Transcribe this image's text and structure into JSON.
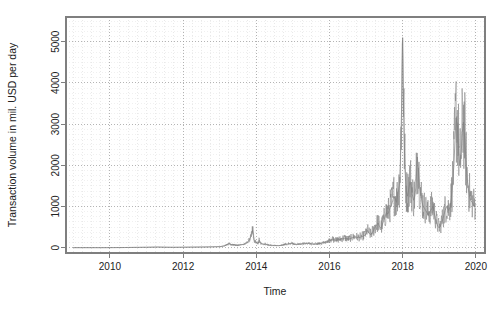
{
  "figure": {
    "background_color": "#ffffff",
    "width": 504,
    "height": 315
  },
  "chart_data": {
    "type": "line",
    "title": "",
    "subtitle": "",
    "xlabel": "Time",
    "ylabel": "Transaction volume in mil. USD per day",
    "xlim": [
      2008.8,
      2020.25
    ],
    "ylim": [
      -130,
      5600
    ],
    "grid": true,
    "grid_style": "dotted",
    "grid_color": "#c8c8c8",
    "legend": null,
    "legend_position": "none",
    "line_color": "#808080",
    "line_width": 0.7,
    "box_color": "#7f7f7f",
    "xticks": [
      2010,
      2012,
      2014,
      2016,
      2018,
      2020
    ],
    "xtick_labels": [
      "2010",
      "2012",
      "2014",
      "2016",
      "2018",
      "2020"
    ],
    "yticks": [
      0,
      1000,
      2000,
      3000,
      4000,
      5000
    ],
    "ytick_labels": [
      "0",
      "1000",
      "2000",
      "3000",
      "4000",
      "5000"
    ],
    "minor_xgrid_spacing": 0.25,
    "minor_ygrid_spacing": 125,
    "annotations": [],
    "series": [
      {
        "name": "Transaction volume",
        "x": [
          2009.0,
          2009.1,
          2009.2,
          2009.3,
          2009.4,
          2009.5,
          2009.6,
          2009.7,
          2009.8,
          2009.9,
          2010.0,
          2010.1,
          2010.2,
          2010.3,
          2010.4,
          2010.5,
          2010.6,
          2010.7,
          2010.8,
          2010.9,
          2011.0,
          2011.1,
          2011.2,
          2011.3,
          2011.4,
          2011.5,
          2011.6,
          2011.7,
          2011.8,
          2011.9,
          2012.0,
          2012.1,
          2012.2,
          2012.3,
          2012.4,
          2012.5,
          2012.6,
          2012.7,
          2012.8,
          2012.9,
          2013.0,
          2013.05,
          2013.1,
          2013.15,
          2013.2,
          2013.25,
          2013.3,
          2013.35,
          2013.4,
          2013.45,
          2013.5,
          2013.55,
          2013.6,
          2013.65,
          2013.7,
          2013.75,
          2013.8,
          2013.85,
          2013.88,
          2013.9,
          2013.92,
          2013.94,
          2013.96,
          2013.98,
          2014.0,
          2014.02,
          2014.05,
          2014.08,
          2014.1,
          2014.12,
          2014.15,
          2014.18,
          2014.2,
          2014.25,
          2014.3,
          2014.35,
          2014.4,
          2014.45,
          2014.5,
          2014.55,
          2014.6,
          2014.65,
          2014.7,
          2014.75,
          2014.8,
          2014.85,
          2014.9,
          2014.95,
          2015.0,
          2015.05,
          2015.1,
          2015.15,
          2015.2,
          2015.25,
          2015.3,
          2015.35,
          2015.4,
          2015.45,
          2015.5,
          2015.55,
          2015.6,
          2015.65,
          2015.7,
          2015.75,
          2015.8,
          2015.85,
          2015.9,
          2015.95,
          2016.0,
          2016.05,
          2016.1,
          2016.15,
          2016.2,
          2016.25,
          2016.3,
          2016.35,
          2016.4,
          2016.45,
          2016.5,
          2016.55,
          2016.6,
          2016.65,
          2016.7,
          2016.75,
          2016.8,
          2016.85,
          2016.9,
          2016.95,
          2017.0,
          2017.03,
          2017.06,
          2017.1,
          2017.13,
          2017.16,
          2017.2,
          2017.23,
          2017.26,
          2017.3,
          2017.33,
          2017.36,
          2017.4,
          2017.43,
          2017.46,
          2017.5,
          2017.53,
          2017.56,
          2017.6,
          2017.63,
          2017.66,
          2017.7,
          2017.73,
          2017.76,
          2017.8,
          2017.83,
          2017.86,
          2017.89,
          2017.92,
          2017.94,
          2017.96,
          2017.98,
          2018.0,
          2018.01,
          2018.02,
          2018.04,
          2018.06,
          2018.08,
          2018.1,
          2018.13,
          2018.16,
          2018.2,
          2018.23,
          2018.26,
          2018.3,
          2018.33,
          2018.36,
          2018.4,
          2018.43,
          2018.46,
          2018.5,
          2018.53,
          2018.56,
          2018.6,
          2018.63,
          2018.66,
          2018.7,
          2018.73,
          2018.76,
          2018.8,
          2018.83,
          2018.86,
          2018.9,
          2018.93,
          2018.96,
          2019.0,
          2019.03,
          2019.06,
          2019.1,
          2019.13,
          2019.16,
          2019.2,
          2019.23,
          2019.26,
          2019.3,
          2019.33,
          2019.36,
          2019.4,
          2019.43,
          2019.46,
          2019.5,
          2019.53,
          2019.56,
          2019.6,
          2019.63,
          2019.66,
          2019.7,
          2019.73,
          2019.76,
          2019.8,
          2019.83,
          2019.86,
          2019.9,
          2019.93,
          2019.96,
          2020.0
        ],
        "values": [
          0,
          0,
          0,
          0,
          0,
          0,
          0,
          0,
          0,
          0,
          1,
          1,
          2,
          2,
          3,
          4,
          5,
          6,
          7,
          8,
          9,
          10,
          12,
          14,
          12,
          10,
          9,
          8,
          8,
          9,
          10,
          11,
          12,
          13,
          14,
          15,
          16,
          18,
          20,
          22,
          25,
          30,
          38,
          50,
          70,
          95,
          80,
          70,
          65,
          60,
          58,
          62,
          70,
          80,
          95,
          120,
          180,
          260,
          340,
          420,
          300,
          200,
          160,
          140,
          120,
          110,
          100,
          180,
          130,
          105,
          95,
          90,
          85,
          80,
          70,
          62,
          58,
          55,
          52,
          50,
          48,
          52,
          60,
          72,
          80,
          88,
          95,
          100,
          92,
          85,
          80,
          78,
          82,
          88,
          95,
          100,
          105,
          98,
          92,
          88,
          86,
          90,
          95,
          100,
          110,
          125,
          140,
          155,
          170,
          180,
          195,
          185,
          175,
          190,
          200,
          215,
          230,
          220,
          205,
          215,
          230,
          245,
          260,
          250,
          240,
          255,
          270,
          290,
          330,
          420,
          380,
          330,
          310,
          360,
          400,
          480,
          520,
          560,
          600,
          520,
          470,
          520,
          600,
          700,
          780,
          850,
          820,
          900,
          980,
          1050,
          1150,
          1250,
          1180,
          1100,
          1250,
          1400,
          1600,
          2100,
          2900,
          3900,
          5100,
          4600,
          3700,
          2700,
          2000,
          1600,
          1350,
          1250,
          1400,
          1600,
          1500,
          1300,
          1150,
          1250,
          1450,
          2200,
          1900,
          1500,
          1250,
          1100,
          1000,
          950,
          900,
          850,
          800,
          850,
          900,
          950,
          1000,
          850,
          700,
          600,
          520,
          480,
          520,
          600,
          700,
          800,
          900,
          1000,
          950,
          900,
          1000,
          1200,
          1500,
          2000,
          2600,
          3150,
          2900,
          2400,
          2000,
          2300,
          2800,
          3050,
          2600,
          2100,
          1700,
          1400,
          1250,
          1150,
          1100,
          1050,
          1000,
          1050
        ]
      }
    ]
  },
  "axes": {
    "x_title": "Time",
    "y_title": "Transaction volume in mil. USD per day"
  }
}
